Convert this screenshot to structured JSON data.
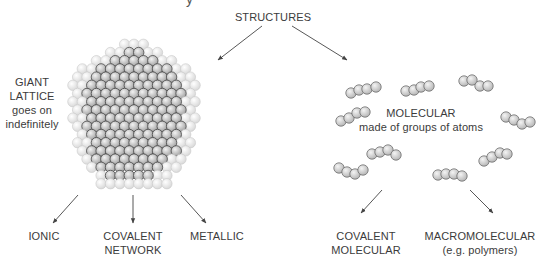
{
  "diagram": {
    "header_cutoff_text": "y",
    "root": {
      "label": "STRUCTURES",
      "x": 273,
      "y": 16
    },
    "giant_lattice": {
      "label_lines": [
        "GIANT",
        "LATTICE",
        "goes on",
        "indefinitely"
      ],
      "label_x": 32,
      "label_y": 103,
      "lattice": {
        "center_x": 134,
        "center_y": 114,
        "atom_r": 5.2,
        "pitch_x": 9.4,
        "pitch_y": 8.2,
        "rows": [
          3,
          6,
          9,
          12,
          13,
          14,
          13,
          14,
          13,
          14,
          13,
          12,
          13,
          12,
          11,
          10,
          8,
          8
        ],
        "inner_rows": [
          0,
          2,
          5,
          8,
          9,
          10,
          11,
          10,
          11,
          10,
          11,
          10,
          9,
          10,
          8,
          7,
          5,
          0
        ],
        "outer_color": "#e4e4e4",
        "inner_color": "#b8b8b8",
        "outer_stroke": "#c9c9c9",
        "inner_stroke": "#4a4a4a"
      },
      "children": [
        {
          "lines": [
            "IONIC"
          ],
          "x": 44,
          "y": 236
        },
        {
          "lines": [
            "COVALENT",
            "NETWORK"
          ],
          "x": 133,
          "y": 236
        },
        {
          "lines": [
            "METALLIC"
          ],
          "x": 217,
          "y": 236
        }
      ]
    },
    "molecular": {
      "label_lines": [
        "MOLECULAR",
        "made of groups of atoms"
      ],
      "label_x": 421,
      "label_y": 113,
      "children": [
        {
          "lines": [
            "COVALENT",
            "MOLECULAR"
          ],
          "x": 366,
          "y": 236
        },
        {
          "lines": [
            "MACROMOLECULAR",
            "(e.g. polymers)"
          ],
          "x": 480,
          "y": 236
        }
      ],
      "molecules": [
        [
          [
            351,
            93
          ],
          [
            359,
            90
          ],
          [
            367,
            89
          ],
          [
            376,
            87
          ]
        ],
        [
          [
            406,
            91
          ],
          [
            414,
            90
          ],
          [
            421,
            87
          ],
          [
            429,
            86
          ]
        ],
        [
          [
            464,
            81
          ],
          [
            472,
            80
          ],
          [
            480,
            86
          ],
          [
            488,
            86
          ]
        ],
        [
          [
            341,
            121
          ],
          [
            349,
            118
          ],
          [
            357,
            113
          ],
          [
            365,
            112
          ]
        ],
        [
          [
            506,
            117
          ],
          [
            514,
            120
          ],
          [
            522,
            124
          ],
          [
            530,
            122
          ]
        ],
        [
          [
            372,
            154
          ],
          [
            380,
            152
          ],
          [
            388,
            150
          ],
          [
            396,
            155
          ]
        ],
        [
          [
            339,
            168
          ],
          [
            347,
            172
          ],
          [
            355,
            174
          ],
          [
            363,
            170
          ]
        ],
        [
          [
            438,
            175
          ],
          [
            446,
            174
          ],
          [
            454,
            174
          ],
          [
            462,
            176
          ]
        ],
        [
          [
            484,
            161
          ],
          [
            492,
            157
          ],
          [
            500,
            153
          ],
          [
            507,
            154
          ]
        ]
      ],
      "atom_r": 5.2,
      "atom_color": "#cfcfcf",
      "atom_stroke": "#6e6e6e"
    },
    "arrows": [
      [
        262,
        26,
        218,
        60
      ],
      [
        292,
        26,
        347,
        60
      ],
      [
        78,
        195,
        53,
        223
      ],
      [
        133,
        195,
        133,
        223
      ],
      [
        181,
        195,
        206,
        223
      ],
      [
        382,
        190,
        361,
        213
      ],
      [
        470,
        190,
        493,
        213
      ]
    ],
    "colors": {
      "text": "#3b3b3b",
      "arrow": "#444444"
    }
  }
}
